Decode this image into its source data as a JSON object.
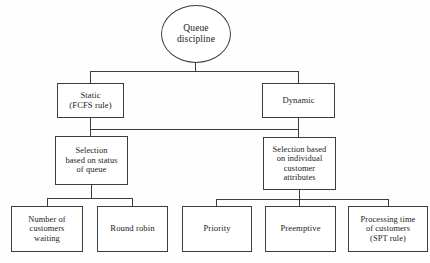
{
  "diagram": {
    "type": "hierarchy-tree",
    "line_color": "#3d3d3d",
    "text_color": "#1b1b1b",
    "background": "#fefefe",
    "nodes": {
      "root": {
        "id": "queue-discipline",
        "shape": "circle",
        "label": "Queue\ndiscipline"
      },
      "level2": [
        {
          "id": "static",
          "shape": "rect",
          "label": "Static\n(FCFS rule)"
        },
        {
          "id": "dynamic",
          "shape": "rect",
          "label": "Dynamic"
        }
      ],
      "level3": [
        {
          "id": "selection-status-queue",
          "shape": "rect",
          "label": "Selection\nbased on status\nof queue"
        },
        {
          "id": "selection-customer-attributes",
          "shape": "rect",
          "label": "Selection based\non individual\ncustomer\nattributes"
        }
      ],
      "level4_left": [
        {
          "id": "number-of-customers-waiting",
          "shape": "rect",
          "label": "Number of\ncustomers\nwaiting"
        },
        {
          "id": "round-robin",
          "shape": "rect",
          "label": "Round robin"
        }
      ],
      "level4_right": [
        {
          "id": "priority",
          "shape": "rect",
          "label": "Priority"
        },
        {
          "id": "preemptive",
          "shape": "rect",
          "label": "Preemptive"
        },
        {
          "id": "processing-time-of-customers",
          "shape": "rect",
          "label": "Processing time\nof customers\n(SPT rule)"
        }
      ]
    },
    "edges": [
      {
        "from": "queue-discipline",
        "to": "static"
      },
      {
        "from": "queue-discipline",
        "to": "dynamic"
      },
      {
        "from": "static",
        "to": "selection-status-queue"
      },
      {
        "from": "dynamic",
        "to": "selection-customer-attributes"
      },
      {
        "from": "selection-status-queue",
        "to": "number-of-customers-waiting"
      },
      {
        "from": "selection-status-queue",
        "to": "round-robin"
      },
      {
        "from": "selection-customer-attributes",
        "to": "priority"
      },
      {
        "from": "selection-customer-attributes",
        "to": "preemptive"
      },
      {
        "from": "selection-customer-attributes",
        "to": "processing-time-of-customers"
      }
    ]
  }
}
